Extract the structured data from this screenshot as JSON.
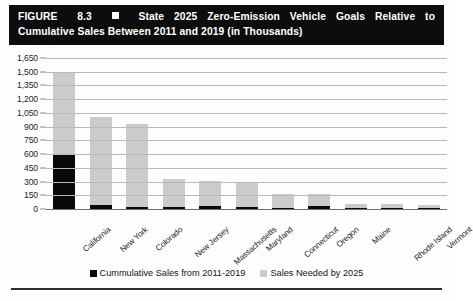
{
  "figure": {
    "label": "FIGURE",
    "number": "8.3",
    "marker_icon": "filled-square-icon",
    "title_line_1": "State 2025 Zero-Emission Vehicle Goals Relative to",
    "title_line_2": "Cumulative Sales Between 2011 and 2019 (in Thousands)",
    "banner_bg": "#0d0d0d",
    "banner_fg": "#ffffff"
  },
  "chart_data": {
    "type": "bar",
    "xlabel": "",
    "ylabel": "",
    "ylim": [
      0,
      1650
    ],
    "ytick_step": 150,
    "grid": true,
    "stacked": false,
    "overlaid": true,
    "legend_position": "bottom-center",
    "units": "thousands of vehicles",
    "categories": [
      "California",
      "New York",
      "Colorado",
      "New Jersey",
      "Massachusetts",
      "Maryland",
      "Connecticut",
      "Oregon",
      "Maine",
      "Rhode Island",
      "Vermont"
    ],
    "ticklabels": [
      "0",
      "150",
      "300",
      "450",
      "600",
      "750",
      "900",
      "1,050",
      "1,200",
      "1,350",
      "1,500",
      "1,650"
    ],
    "series": [
      {
        "name": "Sales Needed by 2025",
        "color": "#cbcbcb",
        "values": [
          1485,
          1010,
          930,
          330,
          310,
          300,
          165,
          160,
          55,
          50,
          45
        ]
      },
      {
        "name": "Cummulative Sales from 2011-2019",
        "color": "#0a0a0a",
        "values": [
          590,
          45,
          18,
          20,
          28,
          25,
          15,
          30,
          8,
          6,
          5
        ]
      }
    ]
  },
  "legend": {
    "items": [
      {
        "label": "Cummulative Sales from 2011-2019",
        "swatch": "black"
      },
      {
        "label": "Sales Needed by 2025",
        "swatch": "gray"
      }
    ]
  }
}
